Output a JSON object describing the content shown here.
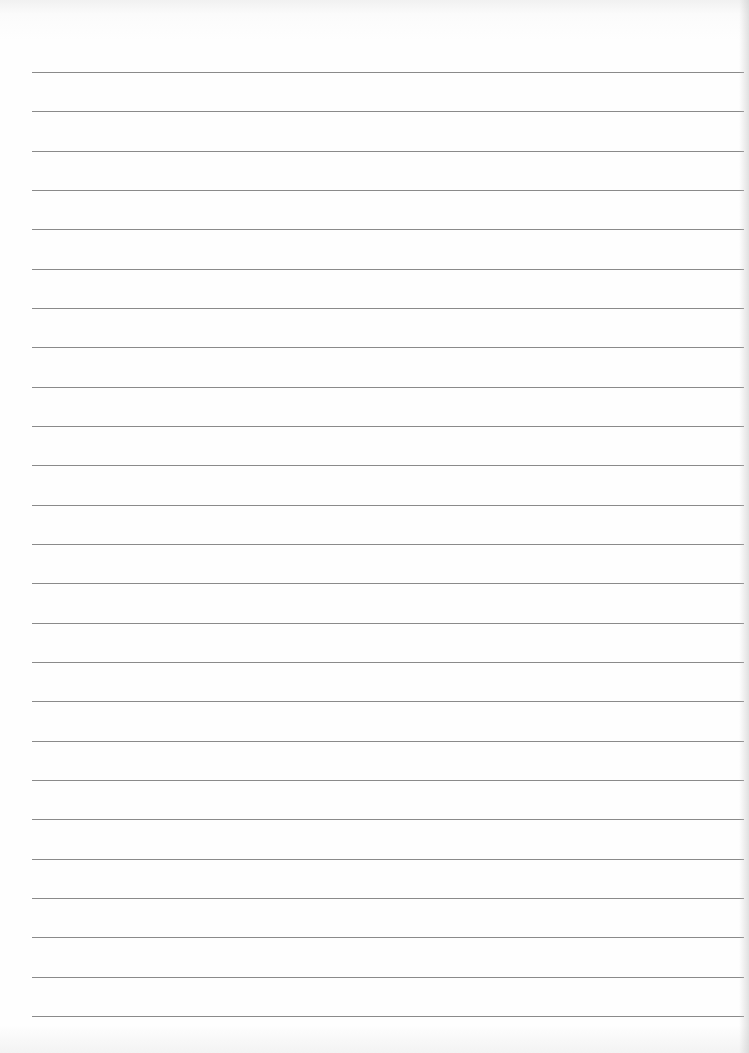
{
  "document": {
    "type": "lined-paper",
    "line_count": 25,
    "first_line_y": 72,
    "line_spacing": 39.33,
    "line_left": 32,
    "line_width": 712,
    "line_color": "#8a8a8a",
    "background_color": "#fefefe",
    "text_content": []
  }
}
